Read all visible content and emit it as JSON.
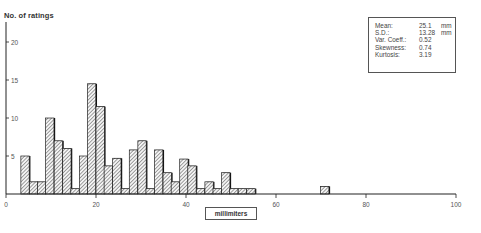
{
  "chart_data": {
    "type": "bar",
    "title": "",
    "xlabel": "millimiters",
    "ylabel": "No. of ratings",
    "xlim": [
      0,
      100
    ],
    "ylim": [
      0,
      22
    ],
    "x_ticks": [
      0,
      20,
      40,
      60,
      80,
      100
    ],
    "y_ticks": [
      5,
      10,
      15,
      20
    ],
    "grid": false,
    "bin_width_mm": 1.86,
    "bins_start_mm": [
      3.3,
      5.2,
      7.0,
      8.8,
      10.7,
      12.6,
      14.4,
      16.3,
      18.1,
      20.0,
      21.8,
      23.7,
      25.6,
      27.4,
      29.3,
      31.1,
      33.0,
      34.9,
      36.7,
      38.6,
      40.4,
      42.3,
      44.2,
      46.0,
      47.9,
      49.7,
      51.6,
      53.5,
      69.9
    ],
    "values": [
      5,
      1.6,
      1.6,
      10,
      7,
      6,
      0.7,
      5,
      14.5,
      11.5,
      3.7,
      4.7,
      0.7,
      5.8,
      7,
      0.7,
      5.8,
      2.8,
      1.6,
      4.6,
      3.7,
      0.7,
      1.6,
      0.7,
      2.8,
      0.7,
      0.7,
      0.7,
      1
    ],
    "fill": "diagonal hatch",
    "annotations": {
      "stats_box": [
        {
          "label": "Mean:",
          "value": "25.1",
          "unit": "mm"
        },
        {
          "label": "S.D.:",
          "value": "13.28",
          "unit": "mm"
        },
        {
          "label": "Var. Coeff.:",
          "value": "0.52",
          "unit": ""
        },
        {
          "label": "Skewness:",
          "value": "0.74",
          "unit": ""
        },
        {
          "label": "Kurtosis:",
          "value": "3.19",
          "unit": ""
        }
      ]
    }
  },
  "labels": {
    "ylabel": "No. of ratings",
    "xlabel": "millimiters"
  }
}
